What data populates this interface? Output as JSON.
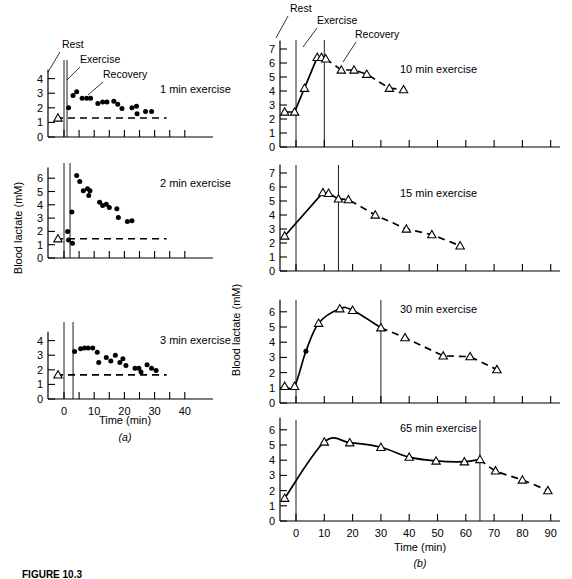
{
  "figure": {
    "caption": "FIGURE 10.3",
    "panel_a_label": "(a)",
    "panel_b_label": "(b)",
    "y_axis_label": "Blood lactate (mM)",
    "x_axis_label": "Time (min)",
    "annotations": {
      "rest": "Rest",
      "exercise": "Exercise",
      "recovery": "Recovery"
    }
  },
  "chart_data": [
    {
      "type": "scatter",
      "panel": "a1",
      "title": "1 min exercise",
      "xlabel": "Time (min)",
      "ylabel": "Blood lactate (mM)",
      "xlim": [
        -6,
        46
      ],
      "ylim": [
        0,
        4.6
      ],
      "yticks": [
        0,
        1,
        2,
        3,
        4
      ],
      "xticks": [
        0,
        5,
        10,
        15,
        20,
        25,
        30,
        35,
        40
      ],
      "xticklabels": [
        "",
        "",
        "",
        "",
        "",
        "",
        "",
        "",
        ""
      ],
      "grid": false,
      "vlines": [
        0,
        1
      ],
      "baseline": 1.3,
      "rest_point": {
        "x": -2.0,
        "y": 1.3,
        "marker": "triangle"
      },
      "points": [
        {
          "x": 1.5,
          "y": 2.0
        },
        {
          "x": 3.0,
          "y": 2.85
        },
        {
          "x": 4.2,
          "y": 3.1
        },
        {
          "x": 6.0,
          "y": 2.65
        },
        {
          "x": 7.5,
          "y": 2.65
        },
        {
          "x": 8.8,
          "y": 2.65
        },
        {
          "x": 11.2,
          "y": 2.3
        },
        {
          "x": 12.8,
          "y": 2.4
        },
        {
          "x": 14.2,
          "y": 2.4
        },
        {
          "x": 16.5,
          "y": 2.45
        },
        {
          "x": 17.8,
          "y": 2.25
        },
        {
          "x": 19.2,
          "y": 1.95
        },
        {
          "x": 22.5,
          "y": 2.0
        },
        {
          "x": 24.0,
          "y": 2.1
        },
        {
          "x": 24.2,
          "y": 1.6
        },
        {
          "x": 27.0,
          "y": 1.75
        },
        {
          "x": 29.0,
          "y": 1.75
        }
      ]
    },
    {
      "type": "scatter",
      "panel": "a2",
      "title": "2 min exercise",
      "xlabel": "Time (min)",
      "ylabel": "Blood lactate (mM)",
      "xlim": [
        -6,
        46
      ],
      "ylim": [
        0,
        6.8
      ],
      "yticks": [
        0,
        1,
        2,
        3,
        4,
        5,
        6
      ],
      "xticks": [
        0,
        5,
        10,
        15,
        20,
        25,
        30,
        35,
        40
      ],
      "grid": false,
      "vlines": [
        0,
        2
      ],
      "baseline": 1.45,
      "rest_point": {
        "x": -2.0,
        "y": 1.45,
        "marker": "triangle"
      },
      "points": [
        {
          "x": 1.2,
          "y": 2.0
        },
        {
          "x": 1.5,
          "y": 1.35
        },
        {
          "x": 2.8,
          "y": 1.1
        },
        {
          "x": 2.6,
          "y": 3.45
        },
        {
          "x": 4.2,
          "y": 6.2
        },
        {
          "x": 5.2,
          "y": 5.75
        },
        {
          "x": 6.4,
          "y": 5.05
        },
        {
          "x": 7.8,
          "y": 5.2
        },
        {
          "x": 8.6,
          "y": 5.05
        },
        {
          "x": 8.2,
          "y": 4.7
        },
        {
          "x": 11.8,
          "y": 4.2
        },
        {
          "x": 12.8,
          "y": 3.95
        },
        {
          "x": 14.0,
          "y": 4.05
        },
        {
          "x": 15.0,
          "y": 3.8
        },
        {
          "x": 17.5,
          "y": 3.7
        },
        {
          "x": 18.0,
          "y": 3.05
        },
        {
          "x": 21.0,
          "y": 2.75
        },
        {
          "x": 22.5,
          "y": 2.8
        }
      ]
    },
    {
      "type": "scatter",
      "panel": "a3",
      "title": "3 min exercise",
      "xlabel": "Time (min)",
      "ylabel": "Blood lactate (mM)",
      "xlim": [
        -6,
        46
      ],
      "ylim": [
        0,
        4.6
      ],
      "yticks": [
        0,
        1,
        2,
        3,
        4
      ],
      "xticks": [
        0,
        5,
        10,
        15,
        20,
        25,
        30,
        35,
        40
      ],
      "xticklabels": [
        "0",
        "",
        "10",
        "",
        "20",
        "",
        "30",
        "",
        "40"
      ],
      "grid": false,
      "vlines": [
        0,
        3
      ],
      "baseline": 1.65,
      "rest_point": {
        "x": -2.0,
        "y": 1.65,
        "marker": "triangle"
      },
      "points": [
        {
          "x": 3.5,
          "y": 3.25
        },
        {
          "x": 5.5,
          "y": 3.45
        },
        {
          "x": 6.8,
          "y": 3.5
        },
        {
          "x": 8.0,
          "y": 3.5
        },
        {
          "x": 9.5,
          "y": 3.5
        },
        {
          "x": 11.0,
          "y": 3.2
        },
        {
          "x": 11.5,
          "y": 2.5
        },
        {
          "x": 14.0,
          "y": 2.85
        },
        {
          "x": 15.5,
          "y": 2.6
        },
        {
          "x": 17.0,
          "y": 3.0
        },
        {
          "x": 18.5,
          "y": 2.5
        },
        {
          "x": 19.5,
          "y": 2.75
        },
        {
          "x": 20.5,
          "y": 2.3
        },
        {
          "x": 23.5,
          "y": 2.1
        },
        {
          "x": 24.8,
          "y": 2.1
        },
        {
          "x": 25.5,
          "y": 1.85
        },
        {
          "x": 27.5,
          "y": 2.35
        },
        {
          "x": 29.0,
          "y": 2.1
        },
        {
          "x": 30.5,
          "y": 1.95
        }
      ]
    },
    {
      "type": "line",
      "panel": "b1",
      "title": "10 min exercise",
      "xlabel": "Time (min)",
      "ylabel": "Blood lactate (mM)",
      "xlim": [
        -8,
        92
      ],
      "ylim": [
        0,
        7.6
      ],
      "yticks": [
        0,
        1,
        2,
        3,
        4,
        5,
        6,
        7
      ],
      "xticks": [
        0,
        10,
        20,
        30,
        40,
        50,
        60,
        70,
        80,
        90
      ],
      "grid": false,
      "vlines": [
        0,
        10
      ],
      "exercise_points": [
        {
          "x": -4.0,
          "y": 2.5
        },
        {
          "x": -0.5,
          "y": 2.5
        },
        {
          "x": 3.0,
          "y": 4.2
        },
        {
          "x": 7.5,
          "y": 6.4
        },
        {
          "x": 9.0,
          "y": 6.4
        },
        {
          "x": 10.5,
          "y": 6.3
        }
      ],
      "recovery_points": [
        {
          "x": 10.5,
          "y": 6.3
        },
        {
          "x": 16.0,
          "y": 5.5
        },
        {
          "x": 20.5,
          "y": 5.5
        },
        {
          "x": 25.0,
          "y": 5.2
        },
        {
          "x": 33.0,
          "y": 4.2
        },
        {
          "x": 38.0,
          "y": 4.1
        }
      ]
    },
    {
      "type": "line",
      "panel": "b2",
      "title": "15 min exercise",
      "xlabel": "Time (min)",
      "ylabel": "Blood lactate (mM)",
      "xlim": [
        -8,
        92
      ],
      "ylim": [
        0,
        7.6
      ],
      "yticks": [
        0,
        1,
        2,
        3,
        4,
        5,
        6,
        7
      ],
      "xticks": [
        0,
        10,
        20,
        30,
        40,
        50,
        60,
        70,
        80,
        90
      ],
      "grid": false,
      "vlines": [
        0,
        15
      ],
      "exercise_points": [
        {
          "x": -4.0,
          "y": 2.5
        },
        {
          "x": 9.5,
          "y": 5.6
        },
        {
          "x": 11.5,
          "y": 5.55
        },
        {
          "x": 15.0,
          "y": 5.15
        }
      ],
      "recovery_points": [
        {
          "x": 15.0,
          "y": 5.15
        },
        {
          "x": 18.5,
          "y": 5.1
        },
        {
          "x": 28.0,
          "y": 4.0
        },
        {
          "x": 39.0,
          "y": 3.0
        },
        {
          "x": 48.0,
          "y": 2.6
        },
        {
          "x": 58.0,
          "y": 1.8
        }
      ]
    },
    {
      "type": "line",
      "panel": "b3",
      "title": "30 min exercise",
      "xlabel": "Time (min)",
      "ylabel": "Blood lactate (mM)",
      "xlim": [
        -8,
        92
      ],
      "ylim": [
        0,
        6.8
      ],
      "yticks": [
        0,
        1,
        2,
        3,
        4,
        5,
        6
      ],
      "xticks": [
        0,
        10,
        20,
        30,
        40,
        50,
        60,
        70,
        80,
        90
      ],
      "grid": false,
      "vlines": [
        0,
        30
      ],
      "exercise_points": [
        {
          "x": -4.0,
          "y": 1.1
        },
        {
          "x": -0.5,
          "y": 1.1
        },
        {
          "x": 3.5,
          "y": 3.4
        },
        {
          "x": 8.0,
          "y": 5.25
        },
        {
          "x": 15.5,
          "y": 6.2
        },
        {
          "x": 20.0,
          "y": 6.1
        },
        {
          "x": 30.0,
          "y": 4.95
        }
      ],
      "recovery_points": [
        {
          "x": 30.0,
          "y": 4.95
        },
        {
          "x": 38.5,
          "y": 4.3
        },
        {
          "x": 52.0,
          "y": 3.1
        },
        {
          "x": 61.5,
          "y": 3.05
        },
        {
          "x": 71.0,
          "y": 2.2
        }
      ]
    },
    {
      "type": "line",
      "panel": "b4",
      "title": "65 min exercise",
      "xlabel": "Time (min)",
      "ylabel": "Blood lactate (mM)",
      "xlim": [
        -8,
        92
      ],
      "ylim": [
        0,
        6.8
      ],
      "yticks": [
        0,
        1,
        2,
        3,
        4,
        5,
        6
      ],
      "xticks": [
        0,
        10,
        20,
        30,
        40,
        50,
        60,
        70,
        80,
        90
      ],
      "xticklabels": [
        "0",
        "10",
        "20",
        "30",
        "40",
        "50",
        "60",
        "70",
        "80",
        "90"
      ],
      "grid": false,
      "vlines": [
        0,
        65
      ],
      "exercise_points": [
        {
          "x": -4.0,
          "y": 1.5
        },
        {
          "x": 10.0,
          "y": 5.2
        },
        {
          "x": 19.0,
          "y": 5.15
        },
        {
          "x": 30.0,
          "y": 4.85
        },
        {
          "x": 40.0,
          "y": 4.2
        },
        {
          "x": 49.5,
          "y": 3.95
        },
        {
          "x": 59.5,
          "y": 3.9
        },
        {
          "x": 65.0,
          "y": 4.05
        }
      ],
      "recovery_points": [
        {
          "x": 65.0,
          "y": 4.05
        },
        {
          "x": 70.5,
          "y": 3.3
        },
        {
          "x": 80.0,
          "y": 2.7
        },
        {
          "x": 89.0,
          "y": 2.0
        }
      ]
    }
  ]
}
